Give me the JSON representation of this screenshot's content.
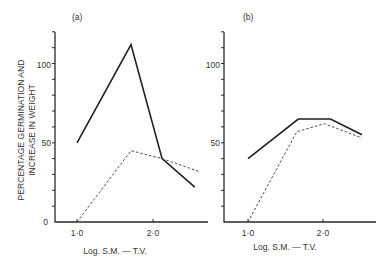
{
  "figure": {
    "ylabel_line1": "PERCENTAGE GERMINATION AND",
    "ylabel_line2": "INCREASE IN WEIGHT",
    "panels": [
      {
        "label": "(a)",
        "xlabel": "Log. S.M. — T.V.",
        "xticks": [
          "1·0",
          "2·0"
        ],
        "yticks": [
          "0",
          "50",
          "100"
        ]
      },
      {
        "label": "(b)",
        "xlabel": "Log. S.M. — T.V.",
        "xticks": [
          "1·0",
          "2·0"
        ],
        "yticks": [
          "0",
          "50",
          "100"
        ]
      }
    ]
  },
  "chart_data": [
    {
      "type": "line",
      "title": "(a)",
      "xlabel": "Log. S.M. — T.V.",
      "ylabel": "PERCENTAGE GERMINATION AND INCREASE IN WEIGHT",
      "xlim": [
        0.7,
        2.7
      ],
      "ylim": [
        0,
        120
      ],
      "xticks": [
        1.0,
        2.0
      ],
      "yticks_labeled": [
        0,
        50,
        100
      ],
      "ytick_interval": 10,
      "grid": false,
      "series": [
        {
          "name": "solid",
          "style": "solid",
          "x": [
            1.0,
            1.71,
            2.12,
            2.55
          ],
          "y": [
            50,
            112,
            40,
            22
          ]
        },
        {
          "name": "dashed",
          "style": "dashed",
          "x": [
            1.0,
            1.71,
            2.12,
            2.6
          ],
          "y": [
            0,
            45,
            40,
            32
          ]
        }
      ]
    },
    {
      "type": "line",
      "title": "(b)",
      "xlabel": "Log. S.M. — T.V.",
      "ylabel": "",
      "xlim": [
        0.7,
        2.7
      ],
      "ylim": [
        0,
        120
      ],
      "xticks": [
        1.0,
        2.0
      ],
      "yticks_labeled": [
        0,
        50,
        100
      ],
      "ytick_interval": 10,
      "grid": false,
      "series": [
        {
          "name": "solid",
          "style": "solid",
          "x": [
            1.0,
            1.67,
            2.1,
            2.52
          ],
          "y": [
            40,
            65,
            65,
            55
          ]
        },
        {
          "name": "dashed",
          "style": "dashed",
          "x": [
            1.0,
            1.65,
            2.02,
            2.52
          ],
          "y": [
            0,
            57,
            62,
            53
          ]
        }
      ]
    }
  ]
}
